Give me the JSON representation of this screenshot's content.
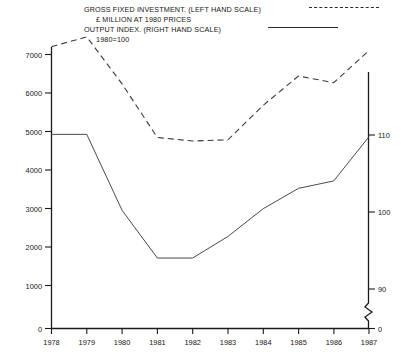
{
  "legend": {
    "line1": "GROSS FIXED INVESTMENT. (LEFT HAND SCALE)",
    "line2": "£ MILLION AT 1980 PRICES",
    "line3": "OUTPUT INDEX. (RIGHT HAND SCALE)",
    "line4": "1980=100",
    "dashed_marker": "dashed-line-sample",
    "solid_marker": "solid-line-sample"
  },
  "axes": {
    "left_ticks": [
      "7000",
      "6000",
      "5000",
      "4000",
      "3000",
      "2000",
      "1000",
      "0"
    ],
    "left_values": [
      7000,
      6000,
      5000,
      4000,
      3000,
      2000,
      1000,
      0
    ],
    "right_ticks": [
      "110",
      "100",
      "90",
      "0"
    ],
    "right_values": [
      110,
      100,
      90,
      0
    ],
    "right_axis_break": true,
    "x_ticks": [
      "1978",
      "1979",
      "1980",
      "1981",
      "1982",
      "1983",
      "1984",
      "1985",
      "1986",
      "1987"
    ],
    "origin_label_left": "0",
    "origin_label_right": "0"
  },
  "chart_data": {
    "type": "line",
    "title": "",
    "subtitle": "",
    "xlabel": "",
    "ylabel": "£ MILLION AT 1980 PRICES",
    "y2label": "OUTPUT INDEX 1980=100",
    "x": [
      1978,
      1979,
      1980,
      1981,
      1982,
      1983,
      1984,
      1985,
      1986,
      1987
    ],
    "categories": [
      "1978",
      "1979",
      "1980",
      "1981",
      "1982",
      "1983",
      "1984",
      "1985",
      "1986",
      "1987"
    ],
    "ylim": [
      0,
      7400
    ],
    "y2lim": [
      88,
      112
    ],
    "grid": false,
    "legend_position": "top",
    "series": [
      {
        "name": "GROSS FIXED INVESTMENT. (LEFT HAND SCALE)",
        "axis": "left",
        "style": "dashed",
        "unit": "£ million at 1980 prices",
        "values": [
          7200,
          7450,
          6250,
          4880,
          4790,
          4820,
          5700,
          6450,
          6280,
          7100
        ]
      },
      {
        "name": "OUTPUT INDEX. (RIGHT HAND SCALE)",
        "axis": "right",
        "style": "solid",
        "unit": "index, 1980=100",
        "values": [
          110.0,
          110.0,
          100.0,
          94.0,
          94.0,
          96.8,
          100.3,
          103.0,
          104.0,
          109.7
        ],
        "values_left_equivalent": [
          4960,
          4960,
          3020,
          1800,
          1800,
          2350,
          3060,
          3580,
          3770,
          4900
        ]
      }
    ]
  }
}
